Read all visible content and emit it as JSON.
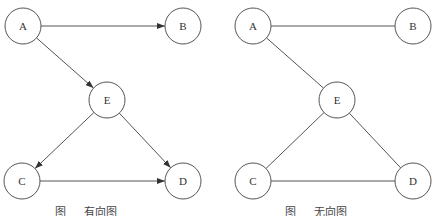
{
  "figures": [
    {
      "id": "directed",
      "caption": {
        "prefix": "图",
        "label": "有向图"
      },
      "directed": true,
      "nodes": [
        {
          "id": "A",
          "label": "A",
          "x": 23,
          "y": 26
        },
        {
          "id": "B",
          "label": "B",
          "x": 183,
          "y": 26
        },
        {
          "id": "E",
          "label": "E",
          "x": 107,
          "y": 100
        },
        {
          "id": "C",
          "label": "C",
          "x": 22,
          "y": 181
        },
        {
          "id": "D",
          "label": "D",
          "x": 183,
          "y": 181
        }
      ],
      "edges": [
        {
          "from": "A",
          "to": "B"
        },
        {
          "from": "A",
          "to": "E"
        },
        {
          "from": "E",
          "to": "C"
        },
        {
          "from": "E",
          "to": "D"
        },
        {
          "from": "C",
          "to": "D"
        }
      ]
    },
    {
      "id": "undirected",
      "caption": {
        "prefix": "图",
        "label": "无向图"
      },
      "directed": false,
      "nodes": [
        {
          "id": "A",
          "label": "A",
          "x": 253,
          "y": 26
        },
        {
          "id": "B",
          "label": "B",
          "x": 413,
          "y": 26
        },
        {
          "id": "E",
          "label": "E",
          "x": 337,
          "y": 100
        },
        {
          "id": "C",
          "label": "C",
          "x": 253,
          "y": 181
        },
        {
          "id": "D",
          "label": "D",
          "x": 413,
          "y": 181
        }
      ],
      "edges": [
        {
          "from": "A",
          "to": "B"
        },
        {
          "from": "A",
          "to": "E"
        },
        {
          "from": "E",
          "to": "C"
        },
        {
          "from": "E",
          "to": "D"
        },
        {
          "from": "C",
          "to": "D"
        }
      ]
    }
  ],
  "style": {
    "node_radius": 18,
    "stroke": "#555555"
  }
}
